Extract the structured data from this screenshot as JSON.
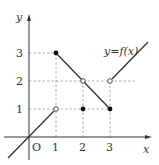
{
  "title": "y=f(x)",
  "axes": {
    "x_label": "x",
    "y_label": "y",
    "origin_label": "O"
  },
  "x_ticks": [
    "1",
    "2",
    "3"
  ],
  "y_ticks": [
    "1",
    "2",
    "3"
  ],
  "function_label": "y=f(x)",
  "segments": [
    {
      "from": [
        -1,
        -1
      ],
      "to": [
        1,
        1
      ],
      "end_open": true
    },
    {
      "from": [
        1,
        3
      ],
      "to": [
        3,
        1
      ],
      "start_filled": true,
      "end_filled": true
    },
    {
      "from": [
        3,
        2
      ],
      "to": [
        4.5,
        3.5
      ],
      "start_open": true
    }
  ],
  "points": [
    {
      "x": 1,
      "y": 1,
      "type": "open"
    },
    {
      "x": 1,
      "y": 3,
      "type": "filled"
    },
    {
      "x": 2,
      "y": 2,
      "type": "open"
    },
    {
      "x": 2,
      "y": 1,
      "type": "filled"
    },
    {
      "x": 3,
      "y": 2,
      "type": "open"
    },
    {
      "x": 3,
      "y": 1,
      "type": "filled"
    }
  ],
  "colors": {
    "line": "#333333",
    "dash": "#888888"
  }
}
